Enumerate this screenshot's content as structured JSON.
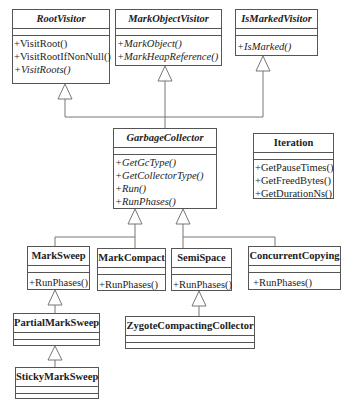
{
  "diagram": {
    "type": "UML class diagram",
    "classes": {
      "root_visitor": {
        "name": "RootVisitor",
        "abstract": true,
        "methods": [
          "+VisitRoot()",
          "+VisitRootIfNonNull()",
          "+VisitRoots()"
        ]
      },
      "mark_object_visitor": {
        "name": "MarkObjectVisitor",
        "abstract": true,
        "methods": [
          "+MarkObject()",
          "+MarkHeapReference()"
        ]
      },
      "is_marked_visitor": {
        "name": "IsMarkedVisitor",
        "abstract": true,
        "methods": [
          "+IsMarked()"
        ]
      },
      "garbage_collector": {
        "name": "GarbageCollector",
        "abstract": true,
        "methods": [
          "+GetGcType()",
          "+GetCollectorType()",
          "+Run()",
          "+RunPhases()"
        ]
      },
      "iteration": {
        "name": "Iteration",
        "abstract": false,
        "methods": [
          "+GetPauseTimes()",
          "+GetFreedBytes()",
          "+GetDurationNs()"
        ]
      },
      "mark_sweep": {
        "name": "MarkSweep",
        "methods": [
          "+RunPhases()"
        ]
      },
      "mark_compact": {
        "name": "MarkCompact",
        "methods": [
          "+RunPhases()"
        ]
      },
      "semi_space": {
        "name": "SemiSpace",
        "methods": [
          "+RunPhases()"
        ]
      },
      "concurrent_copying": {
        "name": "ConcurrentCopying",
        "methods": [
          "+RunPhases()"
        ]
      },
      "partial_mark_sweep": {
        "name": "PartialMarkSweep",
        "methods": []
      },
      "sticky_mark_sweep": {
        "name": "StickyMarkSweep",
        "methods": []
      },
      "zygote_compacting_collector": {
        "name": "ZygoteCompactingCollector",
        "methods": []
      }
    },
    "inheritance": [
      [
        "GarbageCollector",
        "RootVisitor"
      ],
      [
        "GarbageCollector",
        "MarkObjectVisitor"
      ],
      [
        "GarbageCollector",
        "IsMarkedVisitor"
      ],
      [
        "MarkSweep",
        "GarbageCollector"
      ],
      [
        "MarkCompact",
        "GarbageCollector"
      ],
      [
        "SemiSpace",
        "GarbageCollector"
      ],
      [
        "ConcurrentCopying",
        "GarbageCollector"
      ],
      [
        "PartialMarkSweep",
        "MarkSweep"
      ],
      [
        "StickyMarkSweep",
        "PartialMarkSweep"
      ],
      [
        "ZygoteCompactingCollector",
        "SemiSpace"
      ]
    ]
  }
}
